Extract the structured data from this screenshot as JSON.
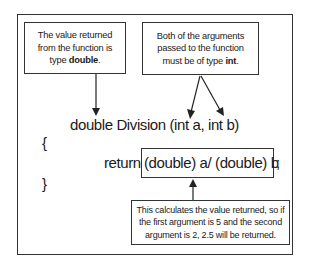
{
  "notes": {
    "return_type": {
      "line1": "The value returned",
      "line2": "from the function is",
      "line3_prefix": "type ",
      "line3_bold": "double",
      "line3_suffix": "."
    },
    "arguments": {
      "line1": "Both of the arguments",
      "line2": "passed to the function",
      "line3_prefix": "must be of type ",
      "line3_bold": "int",
      "line3_suffix": "."
    },
    "calculation": {
      "line1": "This calculates the value returned, so if",
      "line2": "the first argument is 5 and the second",
      "line3": "argument is 2, 2.5 will be returned."
    }
  },
  "code": {
    "signature": "double Division (int a, int b)",
    "open_brace": "{",
    "return_keyword": "return",
    "expression": "(double) a/ (double) b",
    "semicolon": ";",
    "close_brace": "}"
  }
}
